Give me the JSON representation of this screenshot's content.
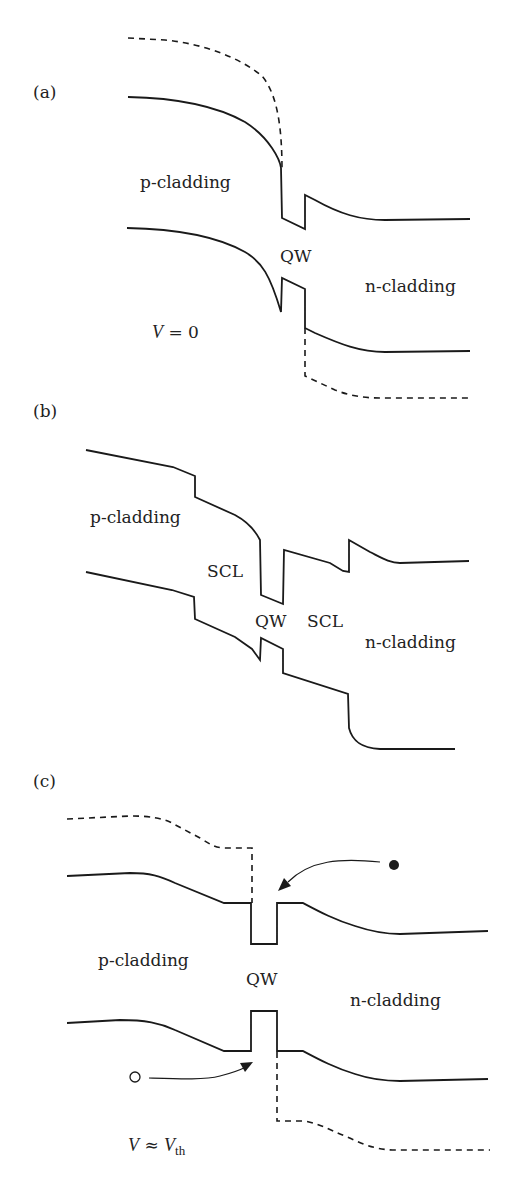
{
  "figure": {
    "panels": [
      {
        "id": "a",
        "panel_label": "(a)",
        "label_pos": [
          33,
          98
        ],
        "condition": "V = 0",
        "condition_var": "V",
        "condition_rest": " = 0",
        "condition_pos": [
          152,
          338
        ],
        "labels": [
          {
            "text": "p-cladding",
            "pos": [
              140,
              188
            ]
          },
          {
            "text": "QW",
            "pos": [
              280,
              262
            ]
          },
          {
            "text": "n-cladding",
            "pos": [
              365,
              292
            ]
          }
        ],
        "paths": {
          "quasi_fermi_top": "M128,38 L165,40 C205,44 240,58 262,76 C278,95 282,130 282,170",
          "conduction_band": "M128,97 C180,98 220,108 245,122 C270,138 280,160 281,168 L282,218 L305,229 L305,195 L315,200 C340,214 360,220 385,220 L470,219",
          "valence_band": "M127,228 C180,229 220,238 245,252 C262,262 270,275 281,312 L282,278 L305,289 L305,328 L315,333 C340,344 360,352 385,352 L470,351",
          "quasi_fermi_bottom": "M305,328 L305,376 L335,390 C350,396 365,398 380,398 L470,398"
        }
      },
      {
        "id": "b",
        "panel_label": "(b)",
        "label_pos": [
          33,
          417
        ],
        "labels": [
          {
            "text": "p-cladding",
            "pos": [
              90,
              523
            ]
          },
          {
            "text": "SCL",
            "pos": [
              207,
              577
            ]
          },
          {
            "text": "QW",
            "pos": [
              255,
              627
            ]
          },
          {
            "text": "SCL",
            "pos": [
              307,
              627
            ]
          },
          {
            "text": "n-cladding",
            "pos": [
              365,
              648
            ]
          }
        ],
        "paths": {
          "conduction_band": "M86,450 L173,467 L195,476 L195,497 L235,515 C248,522 255,530 260,540 L261,595 L283,604 L284,550 L330,563 L343,571 L349,572 L349,540 L370,552 C382,558 390,563 400,563 L469,561",
          "valence_band": "M86,572 L172,590 L194,597 L195,619 L235,637 L252,649 L260,660 L261,638 L283,649 L283,673 L348,694 L349,728 C352,740 360,748 380,749 L455,749"
        }
      },
      {
        "id": "c",
        "panel_label": "(c)",
        "label_pos": [
          33,
          787
        ],
        "condition": "V ≈ Vth",
        "condition_var": "V",
        "condition_approx": " ≈ ",
        "condition_var2": "V",
        "condition_sub": "th",
        "condition_pos": [
          128,
          1151
        ],
        "labels": [
          {
            "text": "p-cladding",
            "pos": [
              98,
              966
            ]
          },
          {
            "text": "QW",
            "pos": [
              246,
              985
            ]
          },
          {
            "text": "n-cladding",
            "pos": [
              350,
              1006
            ]
          }
        ],
        "paths": {
          "quasi_fermi_top": "M67,819 L130,816 C150,816 160,818 170,822 L200,838 C210,844 215,848 225,848 L252,848 L252,903",
          "conduction_band": "M67,876 L130,873 C150,873 160,876 175,883 L224,903 L251,903 L251,944 L277,944 L277,903 L303,903 C320,912 335,920 355,926 C370,931 385,934 400,934 L488,931",
          "valence_band": "M67,1023 L120,1020 C145,1020 160,1023 175,1030 L224,1051 L251,1051 L251,1011 L277,1011 L277,1051 L303,1051 C320,1060 335,1068 355,1074 C370,1079 385,1081 400,1081 L488,1079",
          "quasi_fermi_bottom": "M277,1052 L277,1121 L305,1121 C320,1124 330,1130 345,1136 C360,1143 375,1150 395,1150 L490,1150",
          "electron_arrow": "M380,862 C340,858 310,860 288,882",
          "hole_arrow": "M149,1078 C180,1079 205,1080 220,1076 C232,1073 240,1070 246,1067"
        },
        "carriers": {
          "electron": {
            "cx": 394,
            "cy": 865,
            "r": 5,
            "filled": true,
            "label": "electron"
          },
          "hole": {
            "cx": 135,
            "cy": 1077,
            "r": 5,
            "filled": false,
            "label": "hole"
          }
        },
        "arrowheads": {
          "electron": "M278,891 L284,878 L291,886 Z",
          "hole": "M253,1062 L240,1063 L245,1072 Z"
        }
      }
    ]
  },
  "colors": {
    "stroke": "#1a1a1a",
    "background": "#ffffff",
    "text": "#222222"
  }
}
